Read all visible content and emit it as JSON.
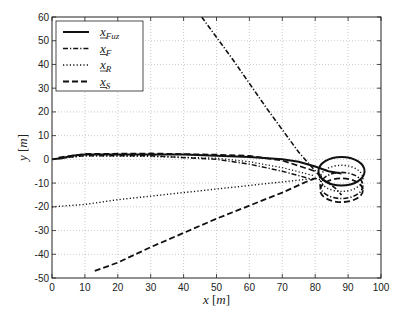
{
  "chart_data": {
    "type": "line",
    "title": "",
    "xlabel": "x [m]",
    "ylabel": "y [m]",
    "xlim": [
      0,
      100
    ],
    "ylim": [
      -50,
      60
    ],
    "xticks": [
      0,
      10,
      20,
      30,
      40,
      50,
      60,
      70,
      80,
      90,
      100
    ],
    "yticks": [
      -50,
      -40,
      -30,
      -20,
      -10,
      0,
      10,
      20,
      30,
      40,
      50,
      60
    ],
    "grid": true,
    "legend_position": "upper left",
    "series": [
      {
        "name": "x_Fuz",
        "style": "solid",
        "description": "Starts near origin, rises to ~2 m, runs flat to ~70 m, then converges into a circular loop centered ~(88,-5) radius ~7",
        "points": [
          [
            0,
            0
          ],
          [
            3,
            0.5
          ],
          [
            6,
            1.5
          ],
          [
            10,
            2
          ],
          [
            20,
            2
          ],
          [
            30,
            2
          ],
          [
            40,
            2
          ],
          [
            50,
            1.5
          ],
          [
            60,
            1
          ],
          [
            70,
            0
          ],
          [
            75,
            -1
          ],
          [
            80,
            -3
          ],
          [
            84,
            -5
          ],
          [
            88,
            -6
          ]
        ]
      },
      {
        "name": "x_F",
        "style": "dashdot",
        "description": "Comes from upper left (45,60) descending diagonally to loop; also flat branch from origin slightly below x_Fuz",
        "points": [
          [
            45.5,
            60
          ],
          [
            55,
            42
          ],
          [
            65,
            22
          ],
          [
            75,
            3
          ],
          [
            82,
            -8
          ],
          [
            86,
            -12
          ],
          [
            88,
            -15
          ]
        ]
      },
      {
        "name": "x_R",
        "style": "dotted",
        "description": "Starts at (0,-20), rises linearly toward loop around (80,-8)",
        "points": [
          [
            0,
            -20
          ],
          [
            10,
            -19
          ],
          [
            20,
            -17
          ],
          [
            30,
            -15.5
          ],
          [
            40,
            -14
          ],
          [
            50,
            -12.5
          ],
          [
            60,
            -11
          ],
          [
            70,
            -9.5
          ],
          [
            80,
            -8
          ],
          [
            85,
            -10
          ]
        ]
      },
      {
        "name": "x_S",
        "style": "dashed",
        "description": "Starts at (13,-47), rises linearly to loop around (82,-8)",
        "points": [
          [
            13,
            -47
          ],
          [
            20,
            -43.5
          ],
          [
            30,
            -37
          ],
          [
            40,
            -31
          ],
          [
            50,
            -25
          ],
          [
            60,
            -19.5
          ],
          [
            70,
            -14
          ],
          [
            78,
            -9
          ],
          [
            82,
            -7
          ]
        ]
      }
    ],
    "loop": {
      "center_x": 88,
      "center_y": -5,
      "radius_x": 7,
      "radius_y": 6,
      "note": "All trajectories circle around ~(88,-8) forming stacked rings between y=0 and y=-20"
    }
  },
  "legend": {
    "items": [
      {
        "label": "x",
        "sub": "Fuz",
        "style": "solid"
      },
      {
        "label": "x",
        "sub": "F",
        "style": "dashdot"
      },
      {
        "label": "x",
        "sub": "R",
        "style": "dotted"
      },
      {
        "label": "x",
        "sub": "S",
        "style": "dashed"
      }
    ]
  },
  "axes": {
    "xlabel_var": "x",
    "ylabel_var": "y",
    "unit": "[m]"
  }
}
